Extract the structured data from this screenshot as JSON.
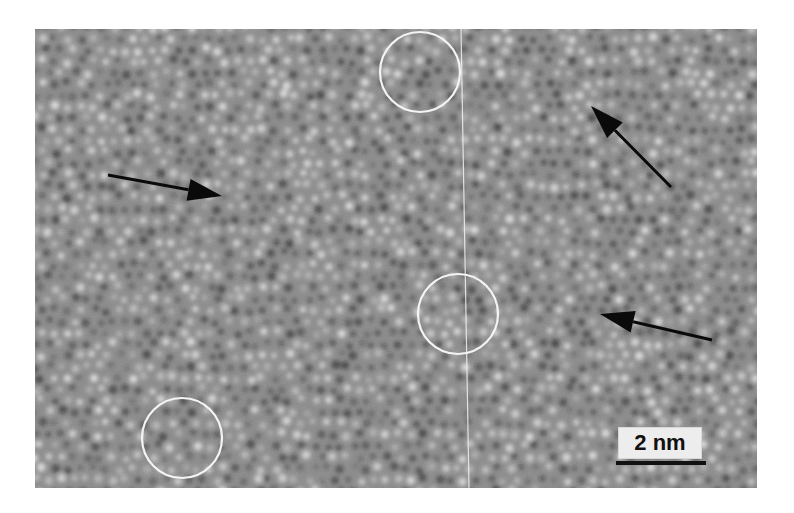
{
  "figure": {
    "type": "HRTEM micrograph",
    "background_color": "#8a8a8a",
    "lattice": {
      "spacing_px": 13,
      "seed": 7
    },
    "scale_bar": {
      "label": "2 nm",
      "x": 618,
      "y": 427,
      "w": 82,
      "h": 30,
      "bar_y": 461,
      "bar_x": 616,
      "bar_w": 90
    },
    "circles": [
      {
        "id": "circle-top",
        "cx": 420,
        "cy": 72,
        "r": 40
      },
      {
        "id": "circle-middle",
        "cx": 458,
        "cy": 314,
        "r": 40
      },
      {
        "id": "circle-bottom-left",
        "cx": 182,
        "cy": 438,
        "r": 40
      }
    ],
    "arrows": [
      {
        "id": "arrow-left",
        "x1": 108,
        "y1": 175,
        "x2": 222,
        "y2": 196
      },
      {
        "id": "arrow-upper-right",
        "x1": 671,
        "y1": 187,
        "x2": 591,
        "y2": 106
      },
      {
        "id": "arrow-lower-right",
        "x1": 712,
        "y1": 340,
        "x2": 600,
        "y2": 314
      }
    ],
    "vertical_line": {
      "x_top": 461,
      "y_top": 29,
      "x_bottom": 469,
      "y_bottom": 488
    }
  }
}
